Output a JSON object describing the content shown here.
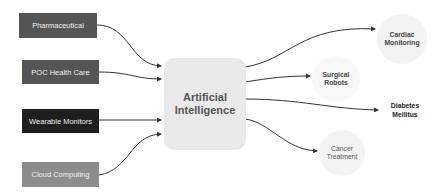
{
  "diagram": {
    "center": {
      "label_line1": "Artificial",
      "label_line2": "Intelligence"
    },
    "inputs": [
      {
        "label": "Pharmaceutical",
        "color": "#555555"
      },
      {
        "label": "POC Health Care",
        "color": "#555555"
      },
      {
        "label": "Wearable Monitors",
        "color": "#1e1e1e"
      },
      {
        "label": "Cloud Computing",
        "color": "#8c8c8c"
      }
    ],
    "outputs": [
      {
        "label_line1": "Cardiac",
        "label_line2": "Monitoring"
      },
      {
        "label_line1": "Surgical",
        "label_line2": "Robots"
      },
      {
        "label_line1": "Diabetes",
        "label_line2": "Mellitus"
      },
      {
        "label_line1": "Cancer",
        "label_line2": "Treatment"
      }
    ],
    "edge_color": "#333333"
  }
}
